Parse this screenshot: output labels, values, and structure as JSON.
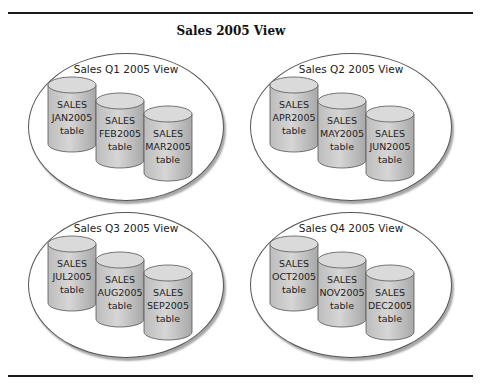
{
  "title": "Sales 2005 View",
  "colors": {
    "cylinder_fill": "#c8c8c8",
    "cylinder_top": "#d9d9d9",
    "outline": "#555555"
  },
  "groups": [
    {
      "label": "Sales Q1 2005 View",
      "tables": [
        {
          "line1": "SALES",
          "line2": "JAN2005",
          "line3": "table"
        },
        {
          "line1": "SALES",
          "line2": "FEB2005",
          "line3": "table"
        },
        {
          "line1": "SALES",
          "line2": "MAR2005",
          "line3": "table"
        }
      ]
    },
    {
      "label": "Sales Q2 2005 View",
      "tables": [
        {
          "line1": "SALES",
          "line2": "APR2005",
          "line3": "table"
        },
        {
          "line1": "SALES",
          "line2": "MAY2005",
          "line3": "table"
        },
        {
          "line1": "SALES",
          "line2": "JUN2005",
          "line3": "table"
        }
      ]
    },
    {
      "label": "Sales Q3 2005 View",
      "tables": [
        {
          "line1": "SALES",
          "line2": "JUL2005",
          "line3": "table"
        },
        {
          "line1": "SALES",
          "line2": "AUG2005",
          "line3": "table"
        },
        {
          "line1": "SALES",
          "line2": "SEP2005",
          "line3": "table"
        }
      ]
    },
    {
      "label": "Sales Q4 2005 View",
      "tables": [
        {
          "line1": "SALES",
          "line2": "OCT2005",
          "line3": "table"
        },
        {
          "line1": "SALES",
          "line2": "NOV2005",
          "line3": "table"
        },
        {
          "line1": "SALES",
          "line2": "DEC2005",
          "line3": "table"
        }
      ]
    }
  ]
}
